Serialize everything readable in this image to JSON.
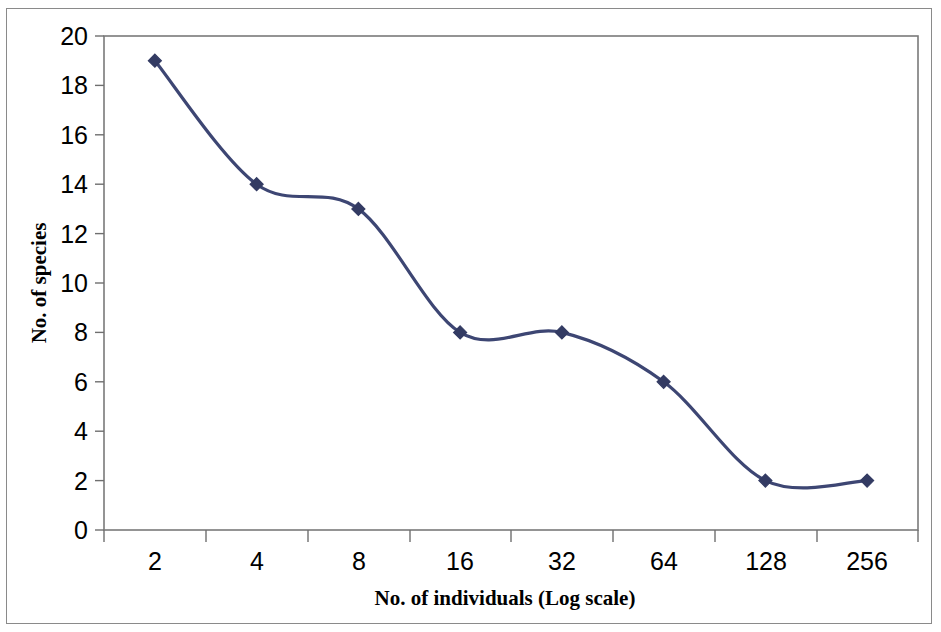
{
  "figure": {
    "background_color": "#ffffff",
    "frame_color": "#8a8a8a",
    "plot_box_color": "#7a7a7a"
  },
  "chart_data": {
    "type": "line",
    "title": "",
    "subtitle": "",
    "xlabel": "No. of individuals (Log scale)",
    "ylabel": "No. of species",
    "categories": [
      "2",
      "4",
      "8",
      "16",
      "32",
      "64",
      "128",
      "256"
    ],
    "x": [
      2,
      4,
      8,
      16,
      32,
      64,
      128,
      256
    ],
    "values": [
      19,
      14,
      13,
      8,
      8,
      6,
      2,
      2
    ],
    "series": [
      {
        "name": "No. of species",
        "values": [
          19,
          14,
          13,
          8,
          8,
          6,
          2,
          2
        ],
        "color": "#3d4673",
        "marker": "diamond",
        "smooth": true
      }
    ],
    "xtick_labels": [
      "2",
      "4",
      "8",
      "16",
      "32",
      "64",
      "128",
      "256"
    ],
    "ytick_labels": [
      "0",
      "2",
      "4",
      "6",
      "8",
      "10",
      "12",
      "14",
      "16",
      "18",
      "20"
    ],
    "yticks": [
      0,
      2,
      4,
      6,
      8,
      10,
      12,
      14,
      16,
      18,
      20
    ],
    "ylim": [
      0,
      20
    ],
    "x_scale": "log2-categorical",
    "grid": false,
    "legend": false,
    "legend_position": "none",
    "annotations": []
  },
  "axis": {
    "y_title": "No. of species",
    "x_title": "No. of individuals (Log scale)",
    "y_labels": [
      "20",
      "18",
      "16",
      "14",
      "12",
      "10",
      "8",
      "6",
      "4",
      "2",
      "0"
    ],
    "x_labels": [
      "2",
      "4",
      "8",
      "16",
      "32",
      "64",
      "128",
      "256"
    ]
  },
  "colors": {
    "series_line": "#3d4673",
    "series_marker": "#333b63",
    "axis": "#6f6f6f",
    "text": "#000000",
    "frame": "#8a8a8a"
  }
}
